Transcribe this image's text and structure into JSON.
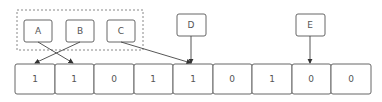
{
  "diagram": {
    "pointers": [
      {
        "label": "A",
        "target_index": 1
      },
      {
        "label": "B",
        "target_index": 0
      },
      {
        "label": "C",
        "target_index": 4
      },
      {
        "label": "D",
        "target_index": 4
      },
      {
        "label": "E",
        "target_index": 7
      }
    ],
    "group": {
      "members": [
        "A",
        "B",
        "C"
      ],
      "style": "dashed"
    },
    "cells": [
      "1",
      "1",
      "0",
      "1",
      "1",
      "0",
      "1",
      "0",
      "0"
    ]
  }
}
